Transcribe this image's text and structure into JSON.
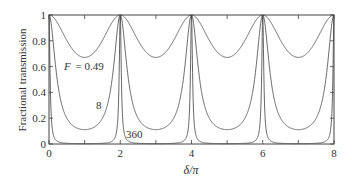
{
  "chart_data": {
    "type": "line",
    "title": "",
    "xlabel": "δ/π",
    "ylabel": "Fractional transmission",
    "xlim": [
      0,
      8
    ],
    "ylim": [
      0,
      1
    ],
    "xticks": [
      0,
      2,
      4,
      6,
      8
    ],
    "xtick_labels": [
      "0",
      "2",
      "4",
      "6",
      "8"
    ],
    "x_minor_ticks": [
      1,
      3,
      5,
      7
    ],
    "yticks": [
      0,
      0.2,
      0.4,
      0.6,
      0.8,
      1
    ],
    "ytick_labels": [
      "0",
      "0.2",
      "0.4",
      "0.6",
      "0.8",
      "1"
    ],
    "grid": false,
    "function": "T = 1 / (1 + F sin^2(δ/2))",
    "series": [
      {
        "name": "F = 0.49",
        "F": 0.49,
        "min_transmission": 0.671,
        "label": "F = 0.49",
        "label_prefix": "F",
        "label_value": "= 0.49"
      },
      {
        "name": "8",
        "F": 8,
        "min_transmission": 0.111,
        "label": "8"
      },
      {
        "name": "360",
        "F": 360,
        "min_transmission": 0.0028,
        "label": "360"
      }
    ]
  }
}
